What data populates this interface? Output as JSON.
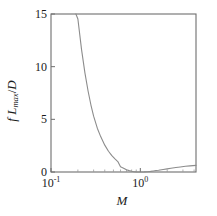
{
  "chart_data": {
    "type": "line",
    "title": "",
    "xlabel": "M",
    "ylabel": "f L_max / D",
    "ylabel_parts": {
      "f": "f",
      "L": "L",
      "max": "max",
      "slash": "/",
      "D": "D"
    },
    "xscale": "log",
    "yscale": "linear",
    "xlim": [
      0.1,
      4.2
    ],
    "ylim": [
      0,
      15
    ],
    "grid": false,
    "legend": null,
    "xticks": [
      {
        "value": 0.1,
        "label": "10",
        "exponent": "-1"
      },
      {
        "value": 1.0,
        "label": "10",
        "exponent": "0"
      }
    ],
    "yticks": [
      {
        "value": 0,
        "label": "0"
      },
      {
        "value": 5,
        "label": "5"
      },
      {
        "value": 10,
        "label": "10"
      },
      {
        "value": 15,
        "label": "15"
      }
    ],
    "xminor_ticks": [
      0.2,
      0.3,
      0.4,
      0.5,
      0.6,
      0.7,
      0.8,
      0.9,
      2.0,
      3.0,
      4.0
    ],
    "series": [
      {
        "name": "Fanno line fL_max/D",
        "x": [
          0.19,
          0.2,
          0.22,
          0.24,
          0.26,
          0.28,
          0.3,
          0.33,
          0.36,
          0.4,
          0.44,
          0.48,
          0.52,
          0.56,
          0.6,
          0.65,
          0.7,
          0.75,
          0.8,
          0.85,
          0.9,
          0.95,
          1.0,
          1.1,
          1.2,
          1.3,
          1.4,
          1.5,
          1.6,
          1.8,
          2.0,
          2.2,
          2.5,
          2.8,
          3.2,
          3.6,
          4.2
        ],
        "y": [
          15.0,
          14.53,
          11.6,
          9.39,
          7.69,
          6.36,
          5.3,
          4.16,
          3.36,
          2.55,
          1.97,
          1.55,
          1.24,
          0.99,
          0.49,
          0.36,
          0.21,
          0.13,
          0.07,
          0.03,
          0.01,
          0.0,
          0.0,
          0.01,
          0.03,
          0.06,
          0.1,
          0.14,
          0.17,
          0.24,
          0.3,
          0.36,
          0.43,
          0.48,
          0.54,
          0.58,
          0.63
        ]
      }
    ],
    "curve_color": "#8c8c8c",
    "axis_color": "#6e6e6e"
  },
  "geometry": {
    "plot_left": 51,
    "plot_right": 196,
    "plot_top": 14,
    "plot_bottom": 172
  }
}
